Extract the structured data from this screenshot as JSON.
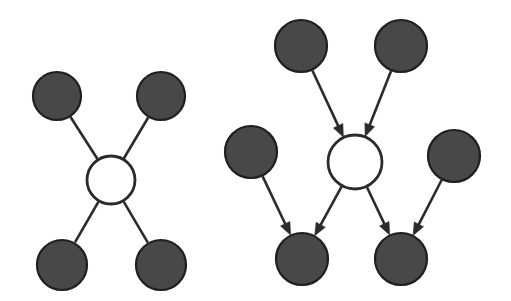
{
  "figure": {
    "width": 511,
    "height": 301,
    "background_color": "#ffffff",
    "filled_node_color": "#484848",
    "filled_node_stroke": "#1f1f1f",
    "hollow_node_fill": "#ffffff",
    "edge_color": "#2b2b2b",
    "edge_width": 2.6,
    "arrow_color": "#2b2b2b"
  },
  "panels": [
    {
      "id": "left-panel",
      "name": "undirected-star-graph",
      "label": "",
      "graph_type": "undirected",
      "directed": false,
      "node_count": 5,
      "edge_count": 4,
      "nodes": [
        {
          "id": "L-center",
          "name": "center-node",
          "style": "hollow",
          "cx": 111,
          "cy": 180,
          "r": 24
        },
        {
          "id": "L-tl",
          "name": "top-left-node",
          "style": "filled",
          "cx": 57,
          "cy": 96,
          "r": 24
        },
        {
          "id": "L-tr",
          "name": "top-right-node",
          "style": "filled",
          "cx": 161,
          "cy": 96,
          "r": 24
        },
        {
          "id": "L-bl",
          "name": "bottom-left-node",
          "style": "filled",
          "cx": 62,
          "cy": 265,
          "r": 25
        },
        {
          "id": "L-br",
          "name": "bottom-right-node",
          "style": "filled",
          "cx": 161,
          "cy": 265,
          "r": 25
        }
      ],
      "edges": [
        {
          "id": "L-e1",
          "name": "edge-center-topleft",
          "from": "L-center",
          "to": "L-tl",
          "arrow": false
        },
        {
          "id": "L-e2",
          "name": "edge-center-topright",
          "from": "L-center",
          "to": "L-tr",
          "arrow": false
        },
        {
          "id": "L-e3",
          "name": "edge-center-bottomleft",
          "from": "L-center",
          "to": "L-bl",
          "arrow": false
        },
        {
          "id": "L-e4",
          "name": "edge-center-bottomright",
          "from": "L-center",
          "to": "L-br",
          "arrow": false
        }
      ]
    },
    {
      "id": "right-panel",
      "name": "directed-acyclic-graph",
      "label": "",
      "graph_type": "directed",
      "directed": true,
      "node_count": 7,
      "edge_count": 6,
      "nodes": [
        {
          "id": "R-center",
          "name": "center-node",
          "style": "hollow",
          "cx": 355,
          "cy": 162,
          "r": 27
        },
        {
          "id": "R-tl",
          "name": "top-left-parent-node",
          "style": "filled",
          "cx": 301,
          "cy": 46,
          "r": 26
        },
        {
          "id": "R-tr",
          "name": "top-right-parent-node",
          "style": "filled",
          "cx": 401,
          "cy": 46,
          "r": 26
        },
        {
          "id": "R-ml",
          "name": "middle-left-node",
          "style": "filled",
          "cx": 251,
          "cy": 152,
          "r": 26
        },
        {
          "id": "R-mr",
          "name": "middle-right-node",
          "style": "filled",
          "cx": 454,
          "cy": 156,
          "r": 26
        },
        {
          "id": "R-bl",
          "name": "bottom-left-child-node",
          "style": "filled",
          "cx": 302,
          "cy": 259,
          "r": 26
        },
        {
          "id": "R-br",
          "name": "bottom-right-child-node",
          "style": "filled",
          "cx": 401,
          "cy": 259,
          "r": 26
        }
      ],
      "edges": [
        {
          "id": "R-e1",
          "name": "arrow-topleft-to-center",
          "from": "R-tl",
          "to": "R-center",
          "arrow": true
        },
        {
          "id": "R-e2",
          "name": "arrow-topright-to-center",
          "from": "R-tr",
          "to": "R-center",
          "arrow": true
        },
        {
          "id": "R-e3",
          "name": "arrow-center-to-bottomleft",
          "from": "R-center",
          "to": "R-bl",
          "arrow": true
        },
        {
          "id": "R-e4",
          "name": "arrow-center-to-bottomright",
          "from": "R-center",
          "to": "R-br",
          "arrow": true
        },
        {
          "id": "R-e5",
          "name": "arrow-middleleft-to-bottomleft",
          "from": "R-ml",
          "to": "R-bl",
          "arrow": true
        },
        {
          "id": "R-e6",
          "name": "arrow-middleright-to-bottomright",
          "from": "R-mr",
          "to": "R-br",
          "arrow": true
        }
      ]
    }
  ]
}
